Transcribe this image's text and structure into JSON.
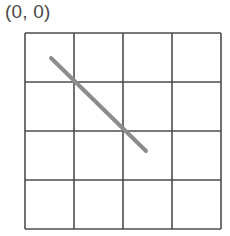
{
  "origin_label": "(0, 0)",
  "grid": {
    "rows": 4,
    "cols": 4,
    "left": 25,
    "top": 33,
    "cell_size": 49,
    "line_color": "#4d4d4d"
  },
  "segment": {
    "x1": 51,
    "y1": 58,
    "x2": 146,
    "y2": 151,
    "color": "#8c8c8c",
    "width": 4
  }
}
